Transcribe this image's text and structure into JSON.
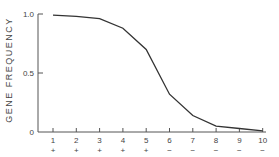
{
  "chart_data": {
    "type": "line",
    "title": "",
    "xlabel": "",
    "ylabel": "GENE FREQUENCY",
    "x": [
      1,
      2,
      3,
      4,
      5,
      6,
      7,
      8,
      9,
      10
    ],
    "x_tick_labels": [
      "1",
      "2",
      "3",
      "4",
      "5",
      "6",
      "7",
      "8",
      "9",
      "10"
    ],
    "x_sign_labels": [
      "+",
      "+",
      "+",
      "+",
      "+",
      "−",
      "−",
      "−",
      "−",
      "−"
    ],
    "y_tick_labels": [
      "0",
      "0.5",
      "1.0"
    ],
    "y_ticks": [
      0,
      0.5,
      1.0
    ],
    "series": [
      {
        "name": "Gene frequency",
        "values": [
          0.99,
          0.98,
          0.96,
          0.88,
          0.7,
          0.32,
          0.14,
          0.05,
          0.03,
          0.01
        ]
      }
    ],
    "ylim": [
      0,
      1.0
    ],
    "xlim": [
      0.35,
      10
    ],
    "grid": false,
    "legend": null
  },
  "style": {
    "line_color": "#333333",
    "axis_color": "#555555",
    "text_color": "#444444"
  }
}
